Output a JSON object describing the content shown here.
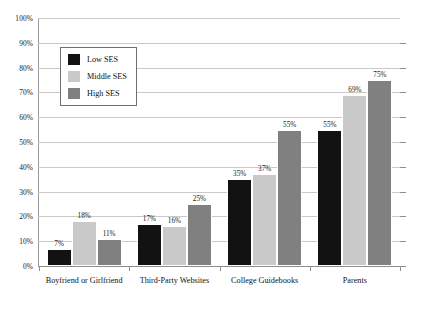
{
  "chart_data": {
    "type": "bar",
    "title": "",
    "subtitle": "",
    "xlabel": "",
    "ylabel": "",
    "ylim": [
      0,
      100
    ],
    "grid": "horizontal",
    "legend_position": "upper-left-inside",
    "categories": [
      "Boyfriend or Girlfriend",
      "Third-Party Websites",
      "College Guidebooks",
      "Parents"
    ],
    "series": [
      {
        "name": "Low SES",
        "color": "#121212",
        "values": [
          7,
          17,
          35,
          55
        ],
        "labels": [
          "7%",
          "17%",
          "35%",
          "55%"
        ]
      },
      {
        "name": "Middle SES",
        "color": "#c9c9c9",
        "values": [
          18,
          16,
          37,
          69
        ],
        "labels": [
          "18%",
          "16%",
          "37%",
          "69%"
        ]
      },
      {
        "name": "High SES",
        "color": "#808080",
        "values": [
          11,
          25,
          55,
          75
        ],
        "labels": [
          "11%",
          "25%",
          "55%",
          "75%"
        ]
      }
    ],
    "y_ticks": [
      {
        "value": 100,
        "label": "100%"
      },
      {
        "value": 90,
        "label": "90%"
      },
      {
        "value": 80,
        "label": "80%"
      },
      {
        "value": 70,
        "label": "70%"
      },
      {
        "value": 60,
        "label": "60%"
      },
      {
        "value": 50,
        "label": "50%"
      },
      {
        "value": 40,
        "label": "40%"
      },
      {
        "value": 30,
        "label": "30%"
      },
      {
        "value": 20,
        "label": "20%"
      },
      {
        "value": 10,
        "label": "10%"
      },
      {
        "value": 0,
        "label": "0%"
      }
    ]
  }
}
